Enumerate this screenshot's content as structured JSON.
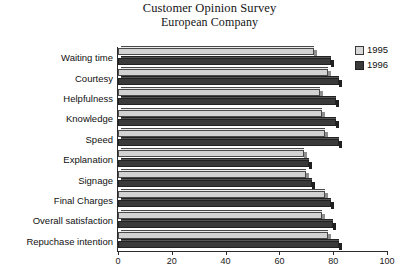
{
  "chart_data": {
    "type": "bar",
    "orientation": "horizontal",
    "title": "Customer Opinion Survey",
    "subtitle": "European Company",
    "xlabel": "",
    "ylabel": "",
    "xlim": [
      0,
      100
    ],
    "xticks": [
      0,
      20,
      40,
      60,
      80,
      100
    ],
    "grid": false,
    "legend_position": "right-top",
    "categories": [
      "Waiting time",
      "Courtesy",
      "Helpfulness",
      "Knowledge",
      "Speed",
      "Explanation",
      "Signage",
      "Final Charges",
      "Overall satisfaction",
      "Repuchase intention"
    ],
    "series": [
      {
        "name": "1995",
        "color": "#d2d2d2",
        "values": [
          73,
          78,
          75,
          76,
          77,
          69,
          70,
          77,
          76,
          78
        ]
      },
      {
        "name": "1996",
        "color": "#3a3a3a",
        "values": [
          79,
          82,
          81,
          81,
          82,
          71,
          72,
          79,
          80,
          82
        ]
      }
    ]
  }
}
